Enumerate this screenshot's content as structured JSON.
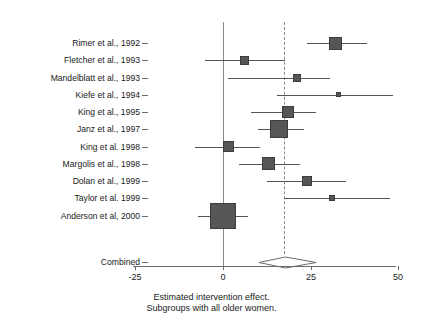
{
  "chart_data": {
    "type": "forest",
    "title": "",
    "xlabel": "Estimated intervention effect.",
    "sublabel": "Subgroups with all older women.",
    "xlim": [
      -32,
      57
    ],
    "xticks": [
      -25,
      0,
      25,
      50
    ],
    "xtick_labels": [
      "-25",
      "0",
      "25",
      "50"
    ],
    "grid": false,
    "legend": "none",
    "reference_line": 0,
    "pooled_line": 17.7,
    "categories": [
      "Rimer et al., 1992",
      "Fletcher et al., 1993",
      "Mandelblatt et al., 1993",
      "Kiefe et al., 1994",
      "King et al., 1995",
      "Janz et al., 1997",
      "King et al. 1998",
      "Margolis et al., 1998",
      "Dolan et al., 1999",
      "Taylor et al. 1999",
      "Anderson et al, 2000"
    ],
    "studies": [
      {
        "label": "Rimer et al., 1992",
        "effect": 32.0,
        "ci_low": 24.0,
        "ci_high": 41.0,
        "weight_px": 13
      },
      {
        "label": "Fletcher et al., 1993",
        "effect": 6.0,
        "ci_low": -5.0,
        "ci_high": 17.8,
        "weight_px": 9
      },
      {
        "label": "Mandelblatt et al., 1993",
        "effect": 21.0,
        "ci_low": 1.5,
        "ci_high": 30.5,
        "weight_px": 8
      },
      {
        "label": "Kiefe et al., 1994",
        "effect": 33.0,
        "ci_low": 15.5,
        "ci_high": 48.5,
        "weight_px": 5
      },
      {
        "label": "King et al., 1995",
        "effect": 18.5,
        "ci_low": 8.0,
        "ci_high": 26.5,
        "weight_px": 12
      },
      {
        "label": "Janz et al., 1997",
        "effect": 16.0,
        "ci_low": 10.0,
        "ci_high": 23.0,
        "weight_px": 18
      },
      {
        "label": "King et al. 1998",
        "effect": 1.5,
        "ci_low": -8.0,
        "ci_high": 10.5,
        "weight_px": 11
      },
      {
        "label": "Margolis et al., 1998",
        "effect": 13.0,
        "ci_low": 4.5,
        "ci_high": 22.0,
        "weight_px": 13
      },
      {
        "label": "Dolan et al., 1999",
        "effect": 24.0,
        "ci_low": 12.5,
        "ci_high": 35.0,
        "weight_px": 10
      },
      {
        "label": "Taylor et al. 1999",
        "effect": 31.0,
        "ci_low": 17.5,
        "ci_high": 47.5,
        "weight_px": 6
      },
      {
        "label": "Anderson et al, 2000",
        "effect": 0.0,
        "ci_low": -7.0,
        "ci_high": 7.0,
        "weight_px": 26
      }
    ],
    "combined": {
      "label": "Combined",
      "effect": 17.7,
      "ci_low": 10.2,
      "ci_high": 26.5
    }
  }
}
